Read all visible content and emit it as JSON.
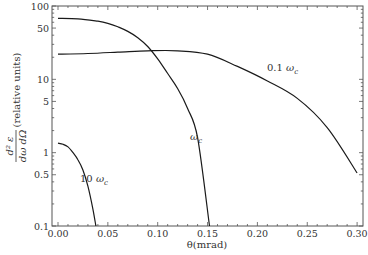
{
  "chart_data": {
    "type": "line",
    "title": "",
    "xlabel": "θ(mrad)",
    "ylabel": "d²ε / dω dΩ (relative units)",
    "ylabel_fraction": {
      "numerator": "d² ε",
      "denominator": "dω dΩ",
      "suffix": "(relative units)"
    },
    "xscale": "linear",
    "yscale": "log",
    "xlim": [
      0.0,
      0.31
    ],
    "ylim": [
      0.1,
      100
    ],
    "grid": false,
    "legend": "none (inline annotations)",
    "x_ticks": [
      "0.00",
      "0.05",
      "0.10",
      "0.15",
      "0.20",
      "0.25",
      "0.30"
    ],
    "x_tick_values": [
      0.0,
      0.05,
      0.1,
      0.15,
      0.2,
      0.25,
      0.3
    ],
    "y_ticks": [
      "100",
      "50",
      "10",
      "5",
      "1",
      "0.5",
      "0.1"
    ],
    "y_tick_values": [
      100,
      50,
      10,
      5,
      1,
      0.5,
      0.1
    ],
    "series": [
      {
        "name": "0.1 ωc",
        "label_prefix": "0.1 ",
        "label_symbol": "ω",
        "label_sub": "c",
        "label_pos": [
          0.225,
          8.5
        ],
        "x": [
          0.0,
          0.03,
          0.06,
          0.09,
          0.12,
          0.15,
          0.18,
          0.21,
          0.24,
          0.27,
          0.3
        ],
        "values": [
          22,
          22.5,
          23.5,
          24.5,
          24.5,
          22,
          15,
          9.5,
          5.5,
          2.2,
          0.53
        ]
      },
      {
        "name": "ωc",
        "label_prefix": "",
        "label_symbol": "ω",
        "label_sub": "c",
        "label_pos": [
          0.138,
          2.6
        ],
        "x": [
          0.0,
          0.02,
          0.04,
          0.05,
          0.06,
          0.07,
          0.08,
          0.09,
          0.1,
          0.11,
          0.12,
          0.13,
          0.14,
          0.152
        ],
        "values": [
          68,
          67,
          62,
          58,
          52,
          45,
          37,
          28,
          19,
          12,
          7.5,
          4,
          1.6,
          0.1
        ]
      },
      {
        "name": "10 ωc",
        "label_prefix": "10 ",
        "label_symbol": "ω",
        "label_sub": "c",
        "label_pos": [
          0.026,
          0.42
        ],
        "x": [
          0.0,
          0.005,
          0.01,
          0.015,
          0.02,
          0.025,
          0.03,
          0.035,
          0.038
        ],
        "values": [
          1.35,
          1.3,
          1.2,
          1.0,
          0.8,
          0.58,
          0.35,
          0.17,
          0.1
        ]
      }
    ]
  }
}
